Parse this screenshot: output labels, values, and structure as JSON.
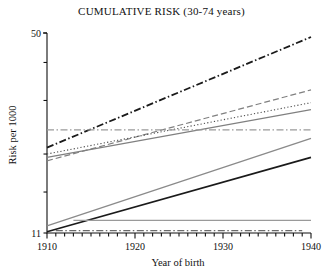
{
  "chart_data": {
    "type": "line",
    "title": "CUMULATIVE RISK (30-74 years)",
    "xlabel": "Year of birth",
    "ylabel": "Risk per 1000",
    "xlim": [
      1910,
      1940
    ],
    "ylim": [
      11,
      50
    ],
    "yscale": "log",
    "grid": false,
    "legend": "none",
    "xticks_major": [
      1910,
      1920,
      1930,
      1940
    ],
    "xtick_labels": [
      "1910",
      "1920",
      "1930",
      "1940"
    ],
    "xticks_minor_step": 1,
    "yticks": [
      11,
      15,
      20,
      30,
      40,
      50
    ],
    "ytick_labels": [
      "11",
      "",
      "",
      "",
      "",
      "50"
    ],
    "x": [
      1910,
      1940
    ],
    "series": [
      {
        "name": "series-1",
        "style": "dash-dot",
        "color": "#1a1a1a",
        "width": 1.8,
        "x": [
          1910,
          1940
        ],
        "values": [
          21.0,
          48.5
        ]
      },
      {
        "name": "series-2",
        "style": "dashed",
        "color": "#808080",
        "width": 1.2,
        "x": [
          1910,
          1940
        ],
        "values": [
          19.0,
          32.5
        ]
      },
      {
        "name": "series-3",
        "style": "dotted",
        "color": "#4d4d4d",
        "width": 1.1,
        "x": [
          1910,
          1940
        ],
        "values": [
          20.0,
          29.5
        ]
      },
      {
        "name": "series-4",
        "style": "solid",
        "color": "#808080",
        "width": 1.2,
        "x": [
          1910,
          1940
        ],
        "values": [
          19.5,
          28.0
        ]
      },
      {
        "name": "series-5",
        "style": "dash-dot",
        "color": "#9a9a9a",
        "width": 1.3,
        "x": [
          1910,
          1940
        ],
        "values": [
          24.0,
          24.0
        ]
      },
      {
        "name": "series-6",
        "style": "solid",
        "color": "#8a8a8a",
        "width": 1.3,
        "x": [
          1910,
          1940
        ],
        "values": [
          11.6,
          22.5
        ]
      },
      {
        "name": "series-7",
        "style": "solid",
        "color": "#1a1a1a",
        "width": 1.6,
        "x": [
          1910,
          1940
        ],
        "values": [
          11.1,
          19.5
        ]
      },
      {
        "name": "series-8",
        "style": "solid",
        "color": "#9a9a9a",
        "width": 1.2,
        "x": [
          1913,
          1940
        ],
        "values": [
          12.1,
          12.1
        ]
      },
      {
        "name": "series-9",
        "style": "dash-dot",
        "color": "#6a6a6a",
        "width": 1.1,
        "x": [
          1911,
          1939
        ],
        "values": [
          11.2,
          11.2
        ]
      }
    ]
  }
}
